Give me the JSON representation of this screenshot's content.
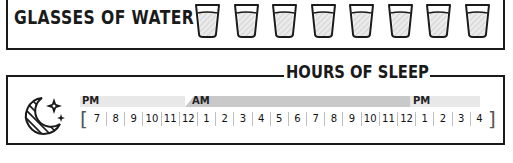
{
  "water": {
    "title": "GLASSES OF WATER",
    "glass_count": 8,
    "glass_icon": "water-glass-icon"
  },
  "sleep": {
    "title": "HOURS OF SLEEP",
    "icon": "moon-stars-icon",
    "period_labels": {
      "start": "PM",
      "middle": "AM",
      "end": "PM"
    },
    "hours": [
      "7",
      "8",
      "9",
      "10",
      "11",
      "12",
      "1",
      "2",
      "3",
      "4",
      "5",
      "6",
      "7",
      "8",
      "9",
      "10",
      "11",
      "12",
      "1",
      "2",
      "3",
      "4"
    ],
    "bracket_open": "[",
    "bracket_close": "]"
  },
  "colors": {
    "ink": "#1a1a1a",
    "band_light": "#e8e8e8",
    "band_dark": "#c9c9c9"
  }
}
